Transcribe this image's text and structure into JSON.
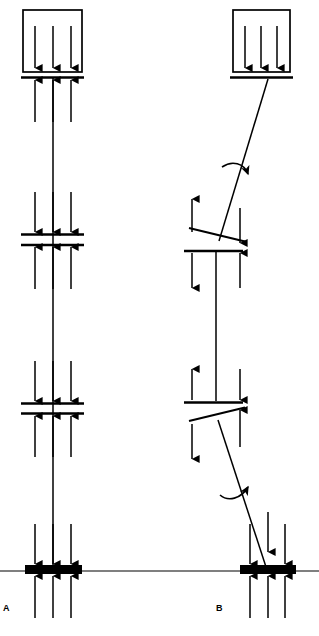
{
  "figure": {
    "title": "",
    "background_color": "#ffffff",
    "stroke_color": "#000000",
    "width": 319,
    "height": 636,
    "panels": [
      {
        "id": "A",
        "label": "A",
        "label_pos": {
          "x": 3,
          "y": 604
        },
        "description": "Vertical column with aligned floor plates, straight load path",
        "axis_x": 53,
        "box": {
          "x": 23,
          "y": 10,
          "w": 59,
          "h": 62,
          "fill": "none",
          "stroke_width": 1.6
        },
        "box_arrows": {
          "direction": "down",
          "count": 3,
          "x_positions": [
            35,
            53,
            71
          ],
          "y_start": 26,
          "y_end": 68
        },
        "plates": [
          {
            "name": "roof-plate",
            "y": 77,
            "x1": 21,
            "x2": 84,
            "style": "single-line",
            "stroke_width": 2.2
          },
          {
            "name": "upper-floor-plate-top",
            "y": 234,
            "x1": 21,
            "x2": 84,
            "style": "double-line",
            "stroke_width": 2.2
          },
          {
            "name": "upper-floor-plate-bottom",
            "y": 245,
            "x1": 21,
            "x2": 84,
            "style": "double-line",
            "stroke_width": 2.2
          },
          {
            "name": "lower-floor-plate-top",
            "y": 403,
            "x1": 21,
            "x2": 84,
            "style": "double-line",
            "stroke_width": 2.2
          },
          {
            "name": "lower-floor-plate-bottom",
            "y": 413,
            "x1": 21,
            "x2": 84,
            "style": "double-line",
            "stroke_width": 2.2
          }
        ],
        "base": {
          "name": "foundation-block",
          "x": 25,
          "y": 565,
          "w": 57,
          "h": 9,
          "fill": "#000000"
        },
        "ground_line": {
          "y": 571,
          "x1": 0,
          "x2": 319,
          "stroke_width": 1.2
        },
        "column": {
          "x": 53,
          "y_top": 78,
          "y_bottom": 566,
          "stroke_width": 1.5
        },
        "force_groups": [
          {
            "name": "roof-reaction-up",
            "direction": "up",
            "x_positions": [
              35,
              53,
              71
            ],
            "tip_y": 80,
            "tail_y": 122
          },
          {
            "name": "upper-floor-load-down",
            "direction": "down",
            "x_positions": [
              35,
              53,
              71
            ],
            "tail_y": 192,
            "tip_y": 232
          },
          {
            "name": "upper-floor-reaction-up",
            "direction": "up",
            "x_positions": [
              35,
              53,
              71
            ],
            "tip_y": 247,
            "tail_y": 289
          },
          {
            "name": "lower-floor-load-down",
            "direction": "down",
            "x_positions": [
              35,
              53,
              71
            ],
            "tail_y": 361,
            "tip_y": 401
          },
          {
            "name": "lower-floor-reaction-up",
            "direction": "up",
            "x_positions": [
              35,
              53,
              71
            ],
            "tip_y": 415,
            "tail_y": 457
          },
          {
            "name": "base-load-down",
            "direction": "down",
            "x_positions": [
              35,
              53,
              71
            ],
            "tail_y": 524,
            "tip_y": 564
          },
          {
            "name": "base-reaction-up",
            "direction": "up",
            "x_positions": [
              35,
              53,
              71
            ],
            "tip_y": 576,
            "tail_y": 618
          }
        ],
        "curved_arrows": []
      },
      {
        "id": "B",
        "label": "B",
        "label_pos": {
          "x": 216,
          "y": 604
        },
        "description": "Column with offset / tilted floor plates, inclined load path with rotation moments",
        "box": {
          "x": 233,
          "y": 10,
          "w": 57,
          "h": 62,
          "fill": "none",
          "stroke_width": 1.6
        },
        "box_arrows": {
          "direction": "down",
          "count": 3,
          "x_positions": [
            244,
            261,
            278
          ],
          "y_start": 26,
          "y_end": 68
        },
        "plates": [
          {
            "name": "roof-plate",
            "y": 77,
            "x1": 231,
            "x2": 293,
            "style": "single-line",
            "stroke_width": 2.2
          },
          {
            "name": "upper-tilted-plate",
            "x1": 189,
            "y1": 228,
            "x2": 244,
            "y2": 241,
            "style": "tilted",
            "stroke_width": 2.0
          },
          {
            "name": "upper-floor-plate",
            "y": 251,
            "x1": 185,
            "x2": 243,
            "style": "single-line",
            "stroke_width": 2.2
          },
          {
            "name": "lower-floor-plate",
            "y": 402,
            "x1": 185,
            "x2": 243,
            "style": "single-line",
            "stroke_width": 2.2
          },
          {
            "name": "lower-tilted-plate",
            "x1": 189,
            "y1": 421,
            "x2": 244,
            "y2": 408,
            "style": "tilted",
            "stroke_width": 2.0
          }
        ],
        "base": {
          "name": "foundation-block",
          "x": 240,
          "y": 565,
          "w": 56,
          "h": 9,
          "fill": "#000000"
        },
        "ground_line": {
          "y": 571,
          "x1": 0,
          "x2": 319,
          "stroke_width": 1.2
        },
        "segments": [
          {
            "name": "upper-inclined-column",
            "x1": 268,
            "y1": 79,
            "x2": 219,
            "y2": 240,
            "stroke_width": 1.5
          },
          {
            "name": "middle-vertical-column",
            "x1": 216,
            "y1": 252,
            "x2": 216,
            "y2": 401,
            "stroke_width": 1.5
          },
          {
            "name": "lower-inclined-column",
            "x1": 218,
            "y1": 420,
            "x2": 267,
            "y2": 570,
            "stroke_width": 1.5
          }
        ],
        "force_groups": [
          {
            "name": "upper-plate-shear-up",
            "direction": "up",
            "x_positions": [
              192
            ],
            "tip_y": 199,
            "tail_y": 233
          },
          {
            "name": "upper-plate-shear-down",
            "direction": "down",
            "x_positions": [
              240
            ],
            "tail_y": 208,
            "tip_y": 243
          },
          {
            "name": "upper-floor-shear-down",
            "direction": "down",
            "x_positions": [
              192
            ],
            "tail_y": 254,
            "tip_y": 288
          },
          {
            "name": "upper-floor-shear-up",
            "direction": "up",
            "x_positions": [
              240
            ],
            "tip_y": 254,
            "tail_y": 288
          },
          {
            "name": "lower-floor-shear-up",
            "direction": "up",
            "x_positions": [
              192
            ],
            "tip_y": 369,
            "tail_y": 400
          },
          {
            "name": "lower-floor-shear-down",
            "direction": "down",
            "x_positions": [
              240
            ],
            "tail_y": 369,
            "tip_y": 400
          },
          {
            "name": "lower-plate-shear-down",
            "direction": "down",
            "x_positions": [
              192
            ],
            "tail_y": 424,
            "tip_y": 459
          },
          {
            "name": "lower-plate-shear-up",
            "direction": "up",
            "x_positions": [
              240
            ],
            "tip_y": 410,
            "tail_y": 447
          },
          {
            "name": "base-load-down",
            "direction": "down",
            "x_positions": [
              250,
              268,
              285
            ],
            "tail_y": 524,
            "tip_y": 564
          },
          {
            "name": "base-reaction-up",
            "direction": "up",
            "x_positions": [
              250,
              268,
              285
            ],
            "tip_y": 576,
            "tail_y": 618
          }
        ],
        "curved_arrows": [
          {
            "name": "upper-rotation-moment",
            "sense": "clockwise",
            "cx": 240,
            "cy": 170,
            "tip_x": 252,
            "tip_y": 182
          },
          {
            "name": "lower-rotation-moment",
            "sense": "counter-clockwise",
            "cx": 240,
            "cy": 492,
            "tip_x": 255,
            "tip_y": 477
          }
        ]
      }
    ]
  }
}
